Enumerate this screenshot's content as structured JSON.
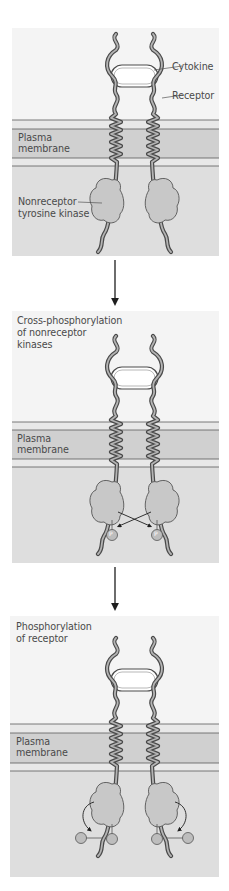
{
  "figure": {
    "colors": {
      "background_upper": "#f4f4f4",
      "cytoplasm": "#dedede",
      "membrane_core": "#d0d0d0",
      "membrane_leaflet": "#e8e8e8",
      "membrane_line": "#5a5a5a",
      "receptor_fill": "#aaaaaa",
      "receptor_stroke": "#4a4a4a",
      "kinase_fill": "#c8c8c8",
      "phosphate_fill": "#bdbdbd",
      "arrow": "#1e1e1e",
      "label_text": "#4a4a4a"
    },
    "panels": [
      {
        "step": 1,
        "title": "",
        "labels": {
          "cytokine": "Cytokine",
          "receptor": "Receptor",
          "membrane": [
            "Plasma",
            "membrane"
          ],
          "kinase": [
            "Nonreceptor",
            "tyrosine kinase"
          ]
        },
        "phosphates": 0
      },
      {
        "step": 2,
        "title": [
          "Cross-phosphorylation",
          "of nonreceptor",
          "kinases"
        ],
        "labels": {
          "membrane": [
            "Plasma",
            "membrane"
          ]
        },
        "phosphates": 2,
        "phosphate_label": "P"
      },
      {
        "step": 3,
        "title": [
          "Phosphorylation",
          "of receptor"
        ],
        "labels": {
          "membrane": [
            "Plasma",
            "membrane"
          ]
        },
        "phosphates": 4,
        "phosphate_label": "P"
      }
    ]
  }
}
